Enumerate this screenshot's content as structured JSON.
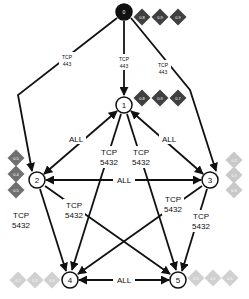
{
  "diagram": {
    "type": "network-flow-graph",
    "nodes": [
      {
        "id": "0",
        "label": "0",
        "x": 124,
        "y": 12,
        "style": "root",
        "scores": {
          "position": "right",
          "values": [
            "0.8",
            "0.9",
            "0.9"
          ],
          "color": "#404040"
        }
      },
      {
        "id": "1",
        "label": "1",
        "x": 124,
        "y": 105,
        "style": "normal",
        "scores": {
          "position": "right",
          "values": [
            "0.8",
            "0.9",
            "0.7"
          ],
          "color": "#404040"
        }
      },
      {
        "id": "2",
        "label": "2",
        "x": 37,
        "y": 180,
        "style": "normal",
        "scores": {
          "position": "left",
          "values": [
            "0.5",
            "0.4",
            "0.5"
          ],
          "color": "#707070"
        }
      },
      {
        "id": "3",
        "label": "3",
        "x": 210,
        "y": 180,
        "style": "normal",
        "scores": {
          "position": "right",
          "values": [
            "0.3",
            "0.3",
            "0.3"
          ],
          "color": "#c8c8c8"
        }
      },
      {
        "id": "4",
        "label": "4",
        "x": 70,
        "y": 280,
        "style": "normal",
        "scores": {
          "position": "left",
          "values": [
            "0.2",
            "0.1",
            "0.1"
          ],
          "color": "#d0d0d0"
        }
      },
      {
        "id": "5",
        "label": "5",
        "x": 178,
        "y": 280,
        "style": "normal",
        "scores": {
          "position": "right",
          "values": [
            "0.2",
            "0.1",
            "0.1"
          ],
          "color": "#d0d0d0"
        }
      }
    ],
    "edges": [
      {
        "from": "0",
        "to": "2",
        "label_line1": "TCP",
        "label_line2": "443",
        "small": true
      },
      {
        "from": "0",
        "to": "1",
        "label_line1": "TCP",
        "label_line2": "443",
        "small": true
      },
      {
        "from": "0",
        "to": "3",
        "label_line1": "TCP",
        "label_line2": "443",
        "small": true
      },
      {
        "from": "1",
        "to": "2",
        "label_line1": "ALL",
        "label_line2": "",
        "bidirectional": true
      },
      {
        "from": "1",
        "to": "3",
        "label_line1": "ALL",
        "label_line2": "",
        "bidirectional": true
      },
      {
        "from": "2",
        "to": "3",
        "label_line1": "ALL",
        "label_line2": "",
        "bidirectional": true
      },
      {
        "from": "4",
        "to": "5",
        "label_line1": "ALL",
        "label_line2": "",
        "bidirectional": true
      },
      {
        "from": "1",
        "to": "4",
        "label_line1": "TCP",
        "label_line2": "5432"
      },
      {
        "from": "1",
        "to": "5",
        "label_line1": "TCP",
        "label_line2": "5432"
      },
      {
        "from": "2",
        "to": "4",
        "label_line1": "TCP",
        "label_line2": "5432"
      },
      {
        "from": "2",
        "to": "5",
        "label_line1": "TCP",
        "label_line2": "5432"
      },
      {
        "from": "3",
        "to": "4",
        "label_line1": "TCP",
        "label_line2": "5432"
      },
      {
        "from": "3",
        "to": "5",
        "label_line1": "TCP",
        "label_line2": "5432"
      }
    ]
  }
}
